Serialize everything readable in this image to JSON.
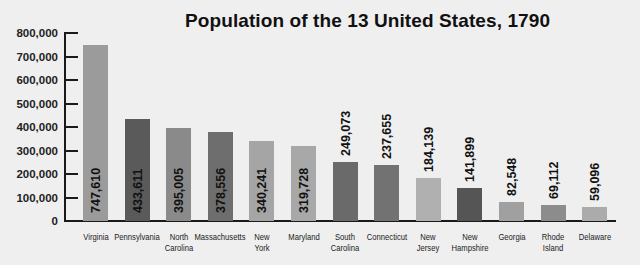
{
  "chart_data": {
    "type": "bar",
    "title": "Population of the 13 United States, 1790",
    "xlabel": "",
    "ylabel": "",
    "ylim": [
      0,
      800000
    ],
    "yticks": [
      "0",
      "100,000",
      "200,000",
      "300,000",
      "400,000",
      "500,000",
      "600,000",
      "700,000",
      "800,000"
    ],
    "grid": false,
    "legend": null,
    "categories": [
      "Virginia",
      "Pennsylvania",
      "North Carolina",
      "Massachusetts",
      "New York",
      "Maryland",
      "South Carolina",
      "Connecticut",
      "New Jersey",
      "New Hampshire",
      "Georgia",
      "Rhode Island",
      "Delaware"
    ],
    "category_lines": [
      [
        "Virginia"
      ],
      [
        "Pennsylvania"
      ],
      [
        "North",
        "Carolina"
      ],
      [
        "Massachusetts"
      ],
      [
        "New",
        "York"
      ],
      [
        "Maryland"
      ],
      [
        "South",
        "Carolina"
      ],
      [
        "Connecticut"
      ],
      [
        "New",
        "Jersey"
      ],
      [
        "New",
        "Hampshire"
      ],
      [
        "Georgia"
      ],
      [
        "Rhode",
        "Island"
      ],
      [
        "Delaware"
      ]
    ],
    "values": [
      747610,
      433611,
      395005,
      378556,
      340241,
      319728,
      249073,
      237655,
      184139,
      141899,
      82548,
      69112,
      59096
    ],
    "value_labels": [
      "747,610",
      "433,611",
      "395,005",
      "378,556",
      "340,241",
      "319,728",
      "249,073",
      "237,655",
      "184,139",
      "141,899",
      "82,548",
      "69,112",
      "59,096"
    ],
    "colors": [
      "#9b9b9b",
      "#5a5a5a",
      "#8a8a8a",
      "#6e6e6e",
      "#a5a5a5",
      "#a8a8a8",
      "#6a6a6a",
      "#727272",
      "#b0b0b0",
      "#555555",
      "#a0a0a0",
      "#8c8c8c",
      "#ababab"
    ]
  }
}
